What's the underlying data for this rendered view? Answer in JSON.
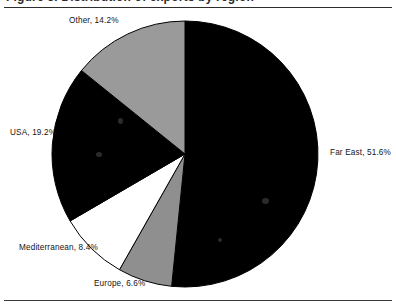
{
  "figure": {
    "clipped_title": "Figure 3. Distribution of exports by region",
    "background_color": "#ffffff",
    "rule_color": "#2d2d2d"
  },
  "chart_data": {
    "type": "pie",
    "title": "",
    "xlabel": "",
    "ylabel": "",
    "legend_position": "none",
    "labels_outside": true,
    "start_angle_deg": 0,
    "direction": "clockwise",
    "categories": [
      "Far East",
      "Europe",
      "Mediterranean",
      "USA",
      "Other"
    ],
    "values": [
      51.6,
      6.6,
      8.4,
      19.2,
      14.2
    ],
    "value_unit": "%",
    "total": 100.0,
    "slice_colors": [
      "#000000",
      "#8f8f8f",
      "#ffffff",
      "#000000",
      "#9a9a9a"
    ],
    "slice_edge_color": "#000000",
    "data_labels": [
      "Far East, 51.6%",
      "Europe, 6.6%",
      "Mediterranean, 8.4%",
      "USA, 19.2%",
      "Other, 14.2%"
    ],
    "geometry": {
      "center_x": 185,
      "center_y": 154,
      "radius": 133
    }
  },
  "labels": {
    "far_east": "Far East, 51.6%",
    "europe": "Europe, 6.6%",
    "mediterranean": "Mediterranean, 8.4%",
    "usa": "USA, 19.2%",
    "other": "Other, 14.2%"
  }
}
